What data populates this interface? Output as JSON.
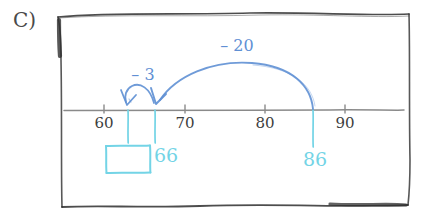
{
  "problem": {
    "part_label": "C)",
    "description": "Open number line showing subtraction by jumping back from 86 to 66 then to 63, with the final answer box blank"
  },
  "colors": {
    "ink_black": "#3d3d3d",
    "arc_blue": "#5f90d4",
    "marker_cyan": "#73d4e6",
    "axis_gray": "#8a8a8a",
    "paper": "#ffffff"
  },
  "frame": {
    "name": "hand-drawn-box",
    "left": 57,
    "top": 13,
    "right": 410,
    "bottom": 205
  },
  "number_line": {
    "y": 110,
    "x_start": 62,
    "x_end": 405,
    "origin_value": 60,
    "origin_x": 104,
    "px_per_unit": 8.05,
    "ticks": [
      {
        "value": 60,
        "label": "60",
        "x": 104
      },
      {
        "value": 70,
        "label": "70",
        "x": 185
      },
      {
        "value": 80,
        "label": "80",
        "x": 265
      },
      {
        "value": 90,
        "label": "90",
        "x": 345
      }
    ],
    "tick_label_y": 116
  },
  "hops": [
    {
      "name": "hop-minus-20",
      "label": "– 20",
      "label_x": 237,
      "label_y": 38,
      "from_value": 86,
      "to_value": 66,
      "from_x": 313,
      "to_x": 155,
      "peak_y": 64,
      "direction": "left"
    },
    {
      "name": "hop-minus-3",
      "label": "– 3",
      "label_x": 143,
      "label_y": 67,
      "from_value": 66,
      "to_value": 63,
      "from_x": 155,
      "to_x": 128,
      "peak_y": 88,
      "direction": "left"
    }
  ],
  "markers": [
    {
      "name": "marker-86",
      "label": "86",
      "value": 86,
      "x": 313,
      "drop_top": 110,
      "drop_bottom": 148,
      "label_x": 303,
      "label_y": 150
    },
    {
      "name": "marker-66",
      "label": "66",
      "value": 66,
      "x": 155,
      "drop_top": 110,
      "drop_bottom": 143,
      "label_x": 154,
      "label_y": 146
    },
    {
      "name": "marker-63",
      "label": "",
      "value": 63,
      "x": 128,
      "drop_top": 110,
      "drop_bottom": 143,
      "label_x": 128,
      "label_y": 146
    }
  ],
  "answer_box": {
    "name": "answer-box",
    "value": "",
    "placeholder": "",
    "left": 104,
    "top": 143,
    "width": 48,
    "height": 32
  }
}
